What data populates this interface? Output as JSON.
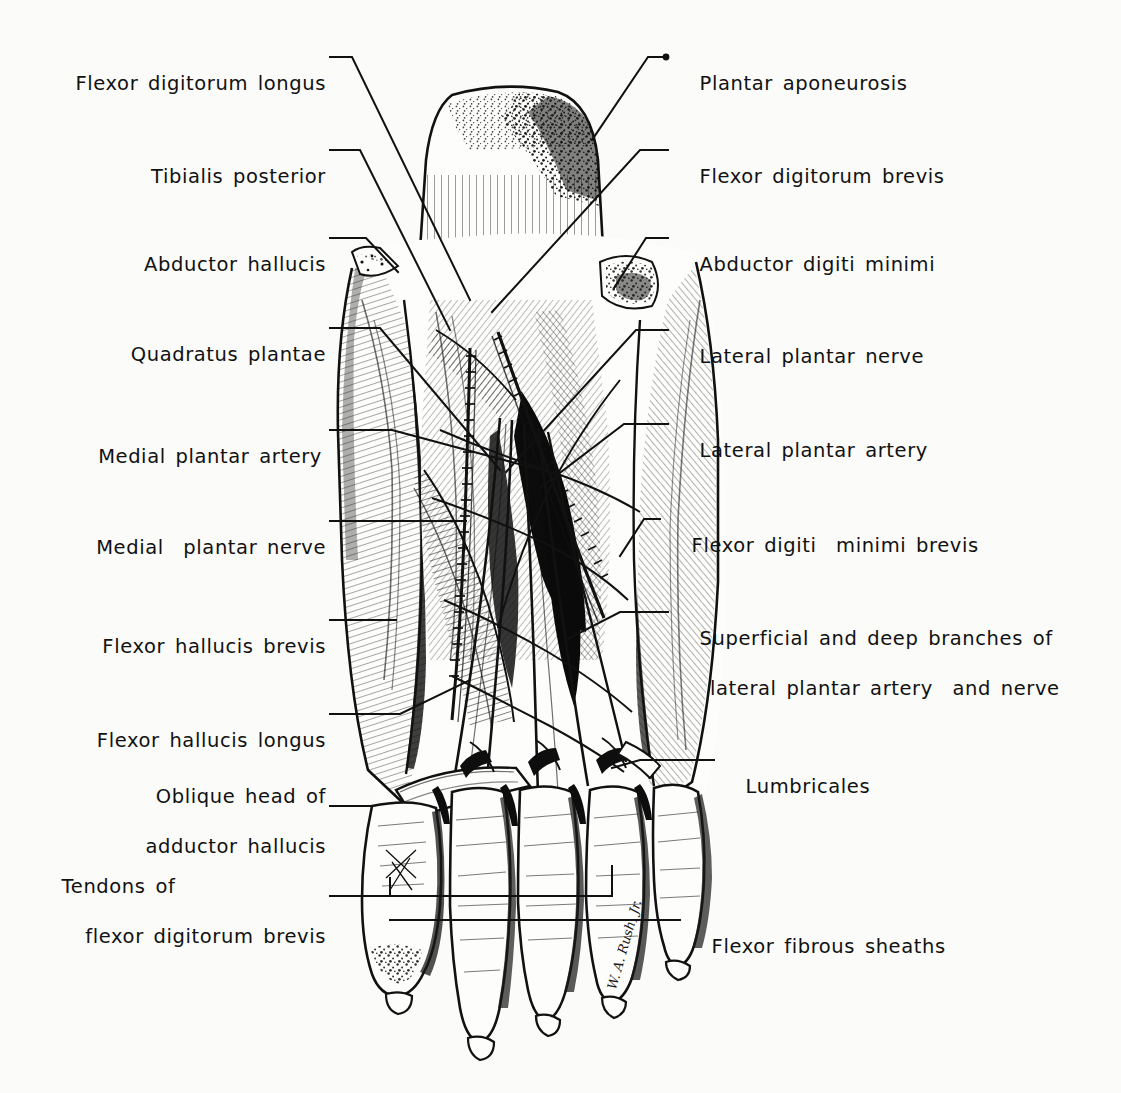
{
  "figure": {
    "background_color": "#fbfbf9",
    "ink_color": "#111111",
    "signature": "W. A. Rush, Jr."
  },
  "labels_left": [
    {
      "id": "flexor-digitorum-longus",
      "line1": "Flexor digitorum longus",
      "line2": ""
    },
    {
      "id": "tibialis-posterior",
      "line1": "Tibialis posterior",
      "line2": ""
    },
    {
      "id": "abductor-hallucis",
      "line1": "Abductor hallucis",
      "line2": ""
    },
    {
      "id": "quadratus-plantae",
      "line1": "Quadratus plantae",
      "line2": ""
    },
    {
      "id": "medial-plantar-artery",
      "line1": "Medial plantar artery",
      "line2": ""
    },
    {
      "id": "medial-plantar-nerve",
      "line1": "Medial  plantar nerve",
      "line2": ""
    },
    {
      "id": "flexor-hallucis-brevis",
      "line1": "Flexor hallucis brevis",
      "line2": ""
    },
    {
      "id": "flexor-hallucis-longus",
      "line1": "Flexor hallucis longus",
      "line2": ""
    },
    {
      "id": "oblique-head-of-adductor-hallucis",
      "line1": "Oblique head of",
      "line2": "adductor hallucis"
    },
    {
      "id": "tendons-of-flexor-digitorum-brevis",
      "line1": "Tendons of",
      "line2": "flexor digitorum brevis"
    }
  ],
  "labels_right": [
    {
      "id": "plantar-aponeurosis",
      "line1": "Plantar aponeurosis",
      "line2": ""
    },
    {
      "id": "flexor-digitorum-brevis",
      "line1": "Flexor digitorum brevis",
      "line2": ""
    },
    {
      "id": "abductor-digiti-minimi",
      "line1": "Abductor digiti minimi",
      "line2": ""
    },
    {
      "id": "lateral-plantar-nerve",
      "line1": "Lateral plantar nerve",
      "line2": ""
    },
    {
      "id": "lateral-plantar-artery",
      "line1": "Lateral plantar artery",
      "line2": ""
    },
    {
      "id": "flexor-digiti-minimi-brevis",
      "line1": "Flexor digiti  minimi brevis",
      "line2": ""
    },
    {
      "id": "superficial-and-deep-branches",
      "line1": "Superficial and deep branches of",
      "line2": "lateral plantar artery  and nerve"
    },
    {
      "id": "lumbricales",
      "line1": "Lumbricales",
      "line2": ""
    },
    {
      "id": "flexor-fibrous-sheaths",
      "line1": "Flexor fibrous sheaths",
      "line2": ""
    }
  ]
}
